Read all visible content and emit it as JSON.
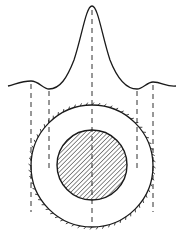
{
  "figure": {
    "colors": {
      "stroke": "#1a1a1a",
      "background": "#ffffff"
    },
    "profile": {
      "peak": {
        "x": 92,
        "y": 6
      },
      "side_lobes": [
        {
          "x": 31,
          "y": 82
        },
        {
          "x": 153,
          "y": 83
        }
      ],
      "minima": [
        {
          "x": 49,
          "y": 89
        },
        {
          "x": 137,
          "y": 89
        }
      ]
    },
    "dashed_lines_x": [
      31,
      49,
      92,
      137,
      153
    ],
    "outer_ring": {
      "cx": 92,
      "cy": 166,
      "r": 61
    },
    "inner_disk": {
      "cx": 92,
      "cy": 165,
      "r": 35,
      "fill": "hatched"
    },
    "caption": ""
  }
}
